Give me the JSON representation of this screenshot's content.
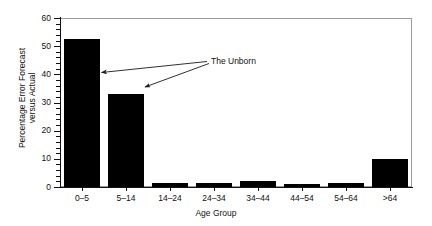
{
  "chart_data": {
    "type": "bar",
    "title": "",
    "xlabel": "Age Group",
    "ylabel": "Percentage Error Forecast versus Actual",
    "ylabel_line1": "Percentage Error Forecast",
    "ylabel_line2": "versus Actual",
    "categories": [
      "0–5",
      "5–14",
      "14–24",
      "24–34",
      "34–44",
      "44–54",
      "54–64",
      ">64"
    ],
    "values": [
      52.5,
      33,
      1.5,
      1.5,
      2,
      1,
      1.5,
      10
    ],
    "ylim": [
      0,
      60
    ],
    "ytick_values": [
      0,
      10,
      20,
      30,
      40,
      50,
      60
    ],
    "ytick_labels": [
      "0",
      "10",
      "20",
      "30",
      "40",
      "50",
      "60"
    ],
    "yminor_step": 2,
    "grid": false,
    "legend": null,
    "bar_color": "#000000",
    "frame_color": "#9a9a9a",
    "axis_color": "#111111",
    "annotations": [
      {
        "text": "The Unborn",
        "points_to": [
          "0–5",
          "5–14"
        ]
      }
    ]
  }
}
